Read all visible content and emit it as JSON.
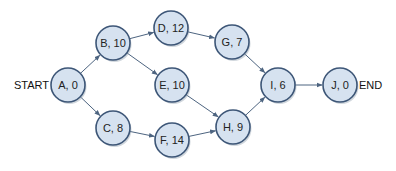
{
  "diagram": {
    "type": "activity-network",
    "start_label": "START",
    "end_label": "END",
    "colors": {
      "node_fill": "#d6e2f0",
      "node_stroke": "#3d5677",
      "edge": "#4d6480",
      "text": "#222222"
    },
    "nodes": [
      {
        "id": "A",
        "label": "A, 0",
        "x": 68,
        "y": 85
      },
      {
        "id": "B",
        "label": "B, 10",
        "x": 113,
        "y": 43
      },
      {
        "id": "C",
        "label": "C, 8",
        "x": 113,
        "y": 128
      },
      {
        "id": "D",
        "label": "D, 12",
        "x": 171,
        "y": 28
      },
      {
        "id": "E",
        "label": "E, 10",
        "x": 172,
        "y": 85
      },
      {
        "id": "F",
        "label": "F, 14",
        "x": 172,
        "y": 140
      },
      {
        "id": "G",
        "label": "G, 7",
        "x": 232,
        "y": 42
      },
      {
        "id": "H",
        "label": "H, 9",
        "x": 233,
        "y": 127
      },
      {
        "id": "I",
        "label": "I, 6",
        "x": 278,
        "y": 85
      },
      {
        "id": "J",
        "label": "J, 0",
        "x": 340,
        "y": 85
      }
    ],
    "edges": [
      [
        "A",
        "B"
      ],
      [
        "A",
        "C"
      ],
      [
        "B",
        "D"
      ],
      [
        "B",
        "E"
      ],
      [
        "C",
        "F"
      ],
      [
        "D",
        "G"
      ],
      [
        "E",
        "H"
      ],
      [
        "F",
        "H"
      ],
      [
        "G",
        "I"
      ],
      [
        "H",
        "I"
      ],
      [
        "I",
        "J"
      ]
    ]
  }
}
